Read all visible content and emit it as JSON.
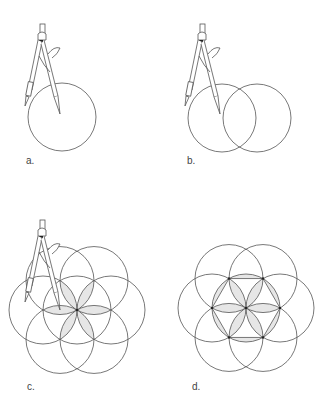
{
  "figure": {
    "panels": [
      {
        "id": "a",
        "label": "a.",
        "circles": 1,
        "has_compass": true
      },
      {
        "id": "b",
        "label": "b.",
        "circles": 2,
        "has_compass": true
      },
      {
        "id": "c",
        "label": "c.",
        "circles": 7,
        "has_compass": true,
        "shaded": "petals"
      },
      {
        "id": "d",
        "label": "d.",
        "circles": 7,
        "has_compass": false,
        "shaded": "petals-and-hexagon-segments"
      }
    ],
    "colors": {
      "stroke": "#555555",
      "fill": "#e6e6e6"
    }
  }
}
